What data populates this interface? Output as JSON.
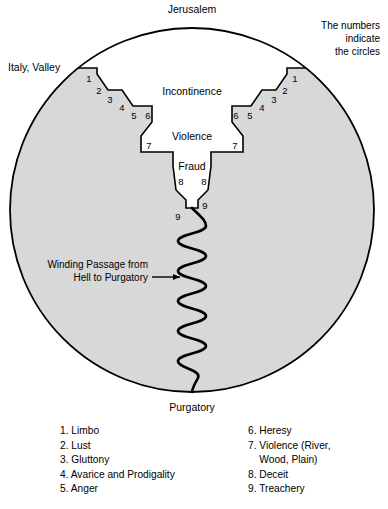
{
  "figure": {
    "title_top": "Jerusalem",
    "title_bottom": "Purgatory",
    "label_left_outside": "Italy, Valley",
    "note_right": [
      "The numbers",
      "indicate",
      "the circles"
    ],
    "regions": {
      "incontinence": "Incontinence",
      "violence": "Violence",
      "fraud": "Fraud"
    },
    "passage_label": [
      "Winding Passage from",
      "Hell to Purgatory"
    ],
    "circle_numbers_left": [
      "1",
      "2",
      "3",
      "4",
      "5",
      "6"
    ],
    "circle_numbers_right": [
      "1",
      "2",
      "3",
      "4",
      "5",
      "6"
    ],
    "violence_number_left": "7",
    "violence_number_right": "7",
    "fraud_numbers": [
      "8",
      "8"
    ],
    "treachery_numbers": [
      "9",
      "9"
    ],
    "colors": {
      "earth_fill": "#d8d8d8",
      "hell_fill": "#ffffff",
      "outline": "#000000",
      "background": "#ffffff"
    }
  },
  "legend": {
    "left_column": [
      "1. Limbo",
      "2. Lust",
      "3. Gluttony",
      "4. Avarice and Prodigality",
      "5. Anger"
    ],
    "right_column": [
      "6. Heresy",
      "7. Violence (River,\n    Wood, Plain)",
      "8. Deceit",
      "9. Treachery"
    ]
  }
}
